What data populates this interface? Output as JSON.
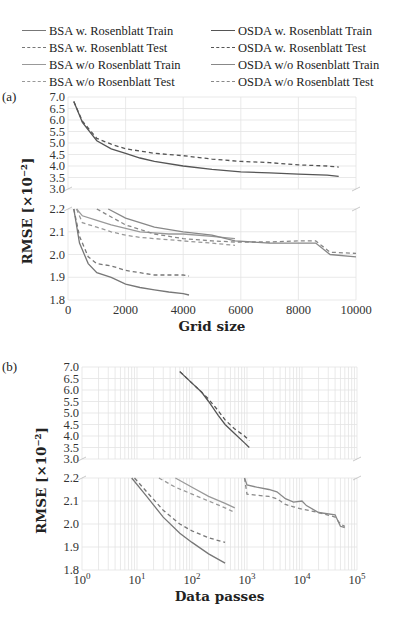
{
  "legend": [
    {
      "label": "BSA w. Rosenblatt Train",
      "style": "solid",
      "color": "#777777"
    },
    {
      "label": "BSA w. Rosenblatt Test",
      "style": "dashed",
      "color": "#777777"
    },
    {
      "label": "BSA w/o Rosenblatt Train",
      "style": "solid",
      "color": "#999999"
    },
    {
      "label": "BSA w/o Rosenblatt Test",
      "style": "dashed",
      "color": "#999999"
    },
    {
      "label": "OSDA w. Rosenblatt Train",
      "style": "solid",
      "color": "#555555"
    },
    {
      "label": "OSDA w. Rosenblatt Test",
      "style": "dashed",
      "color": "#555555"
    },
    {
      "label": "OSDA w/o Rosenblatt Train",
      "style": "solid",
      "color": "#888888"
    },
    {
      "label": "OSDA w/o Rosenblatt Test",
      "style": "dashed",
      "color": "#888888"
    }
  ],
  "panels": {
    "a": {
      "tag": "(a)",
      "xlabel": "Grid size",
      "ylabel": "RMSE [×10⁻²]",
      "xticks": [
        "0",
        "2000",
        "4000",
        "6000",
        "8000",
        "10000"
      ],
      "yticks_upper": [
        "7.0",
        "6.5",
        "6.0",
        "5.5",
        "5.0",
        "4.5",
        "4.0",
        "3.5",
        "3.0"
      ],
      "yticks_lower": [
        "2.2",
        "2.1",
        "2.0",
        "1.9",
        "1.8"
      ]
    },
    "b": {
      "tag": "(b)",
      "xlabel": "Data passes",
      "ylabel": "RMSE [×10⁻²]",
      "xticks": [
        "10^0",
        "10^1",
        "10^2",
        "10^3",
        "10^4",
        "10^5"
      ],
      "yticks_upper": [
        "7.0",
        "6.5",
        "6.0",
        "5.5",
        "5.0",
        "4.5",
        "4.0",
        "3.5",
        "3.0"
      ],
      "yticks_lower": [
        "2.2",
        "2.1",
        "2.0",
        "1.9",
        "1.8"
      ]
    }
  },
  "chart_data": [
    {
      "type": "line",
      "title": "(a)",
      "xlabel": "Grid size",
      "ylabel": "RMSE [x10^-2]",
      "xlim": [
        0,
        10000
      ],
      "ylim_broken": [
        [
          1.8,
          2.2
        ],
        [
          3.0,
          7.0
        ]
      ],
      "grid": true,
      "legend_position": "top",
      "series": [
        {
          "name": "BSA w. Rosenblatt Train",
          "x": [
            200,
            400,
            700,
            1000,
            1500,
            2000,
            2500,
            3000,
            3500,
            4000,
            4200
          ],
          "y": [
            2.2,
            2.05,
            1.96,
            1.92,
            1.9,
            1.87,
            1.855,
            1.845,
            1.835,
            1.828,
            1.822
          ]
        },
        {
          "name": "BSA w. Rosenblatt Test",
          "x": [
            200,
            400,
            700,
            1000,
            1500,
            2000,
            2500,
            3000,
            3500,
            4000,
            4200
          ],
          "y": [
            2.2,
            2.08,
            1.99,
            1.96,
            1.95,
            1.93,
            1.92,
            1.91,
            1.91,
            1.91,
            1.905
          ]
        },
        {
          "name": "BSA w/o Rosenblatt Train",
          "x": [
            300,
            500,
            1000,
            1500,
            2000,
            2500,
            3000,
            3500,
            4000,
            5000,
            5800
          ],
          "y": [
            2.2,
            2.17,
            2.15,
            2.13,
            2.115,
            2.1,
            2.095,
            2.09,
            2.09,
            2.08,
            2.07
          ]
        },
        {
          "name": "BSA w/o Rosenblatt Test",
          "x": [
            300,
            500,
            1000,
            1500,
            2000,
            2500,
            3000,
            3500,
            4000,
            5000,
            5800
          ],
          "y": [
            2.2,
            2.14,
            2.12,
            2.1,
            2.085,
            2.075,
            2.07,
            2.065,
            2.06,
            2.05,
            2.04
          ]
        },
        {
          "name": "OSDA w. Rosenblatt Train",
          "x": [
            200,
            500,
            1000,
            1500,
            2000,
            2500,
            3000,
            4000,
            5000,
            6000,
            7000,
            8000,
            9000,
            9400
          ],
          "y": [
            6.8,
            5.9,
            5.1,
            4.75,
            4.55,
            4.35,
            4.2,
            4.0,
            3.85,
            3.75,
            3.7,
            3.65,
            3.6,
            3.55
          ]
        },
        {
          "name": "OSDA w. Rosenblatt Test",
          "x": [
            200,
            500,
            1000,
            1500,
            2000,
            2500,
            3000,
            4000,
            5000,
            6000,
            7000,
            8000,
            9000,
            9400
          ],
          "y": [
            6.8,
            5.95,
            5.2,
            4.95,
            4.75,
            4.65,
            4.55,
            4.45,
            4.3,
            4.2,
            4.15,
            4.05,
            4.0,
            3.95
          ]
        },
        {
          "name": "OSDA w/o Rosenblatt Train",
          "x": [
            1400,
            2000,
            3000,
            4000,
            5000,
            5800,
            7000,
            8000,
            8600,
            9100,
            10000
          ],
          "y": [
            2.2,
            2.16,
            2.12,
            2.1,
            2.085,
            2.06,
            2.05,
            2.05,
            2.05,
            2.0,
            1.99
          ]
        },
        {
          "name": "OSDA w/o Rosenblatt Test",
          "x": [
            1000,
            2000,
            3000,
            4000,
            5000,
            5800,
            7000,
            8000,
            8600,
            9100,
            10000
          ],
          "y": [
            2.2,
            2.13,
            2.09,
            2.07,
            2.06,
            2.055,
            2.055,
            2.06,
            2.06,
            2.01,
            2.005
          ]
        }
      ]
    },
    {
      "type": "line",
      "title": "(b)",
      "xlabel": "Data passes",
      "ylabel": "RMSE [x10^-2]",
      "xscale": "log",
      "xlim": [
        1,
        100000
      ],
      "ylim_broken": [
        [
          1.8,
          2.2
        ],
        [
          3.0,
          7.0
        ]
      ],
      "grid": true,
      "series": [
        {
          "name": "BSA w. Rosenblatt Train",
          "x": [
            8,
            15,
            30,
            60,
            100,
            200,
            400
          ],
          "y": [
            2.2,
            2.12,
            2.03,
            1.96,
            1.92,
            1.87,
            1.83
          ]
        },
        {
          "name": "BSA w. Rosenblatt Test",
          "x": [
            9,
            15,
            30,
            60,
            100,
            200,
            400
          ],
          "y": [
            2.2,
            2.14,
            2.06,
            2.0,
            1.97,
            1.94,
            1.92
          ]
        },
        {
          "name": "BSA w/o Rosenblatt Train",
          "x": [
            50,
            100,
            200,
            400,
            600
          ],
          "y": [
            2.2,
            2.16,
            2.12,
            2.09,
            2.07
          ]
        },
        {
          "name": "BSA w/o Rosenblatt Test",
          "x": [
            25,
            50,
            100,
            200,
            400,
            600
          ],
          "y": [
            2.2,
            2.16,
            2.13,
            2.1,
            2.07,
            2.05
          ]
        },
        {
          "name": "OSDA w. Rosenblatt Train",
          "x": [
            60,
            100,
            150,
            200,
            300,
            400,
            600,
            900,
            1100
          ],
          "y": [
            6.8,
            6.3,
            5.9,
            5.5,
            4.9,
            4.5,
            4.1,
            3.7,
            3.5
          ]
        },
        {
          "name": "OSDA w. Rosenblatt Test",
          "x": [
            60,
            100,
            150,
            200,
            300,
            400,
            600,
            900,
            1100
          ],
          "y": [
            6.8,
            6.3,
            5.9,
            5.6,
            5.1,
            4.7,
            4.3,
            4.0,
            3.8
          ]
        },
        {
          "name": "OSDA w/o Rosenblatt Train",
          "x": [
            900,
            1000,
            1500,
            2500,
            3500,
            5000,
            7000,
            10000,
            12000,
            20000,
            40000,
            50000,
            60000
          ],
          "y": [
            2.2,
            2.17,
            2.16,
            2.15,
            2.14,
            2.11,
            2.095,
            2.1,
            2.08,
            2.05,
            2.04,
            1.99,
            1.985
          ]
        },
        {
          "name": "OSDA w/o Rosenblatt Test",
          "x": [
            900,
            1000,
            1500,
            2500,
            3500,
            5000,
            7000,
            10000,
            20000,
            40000,
            50000,
            60000
          ],
          "y": [
            2.2,
            2.13,
            2.125,
            2.12,
            2.11,
            2.085,
            2.075,
            2.065,
            2.05,
            2.03,
            2.0,
            1.99
          ]
        }
      ]
    }
  ]
}
